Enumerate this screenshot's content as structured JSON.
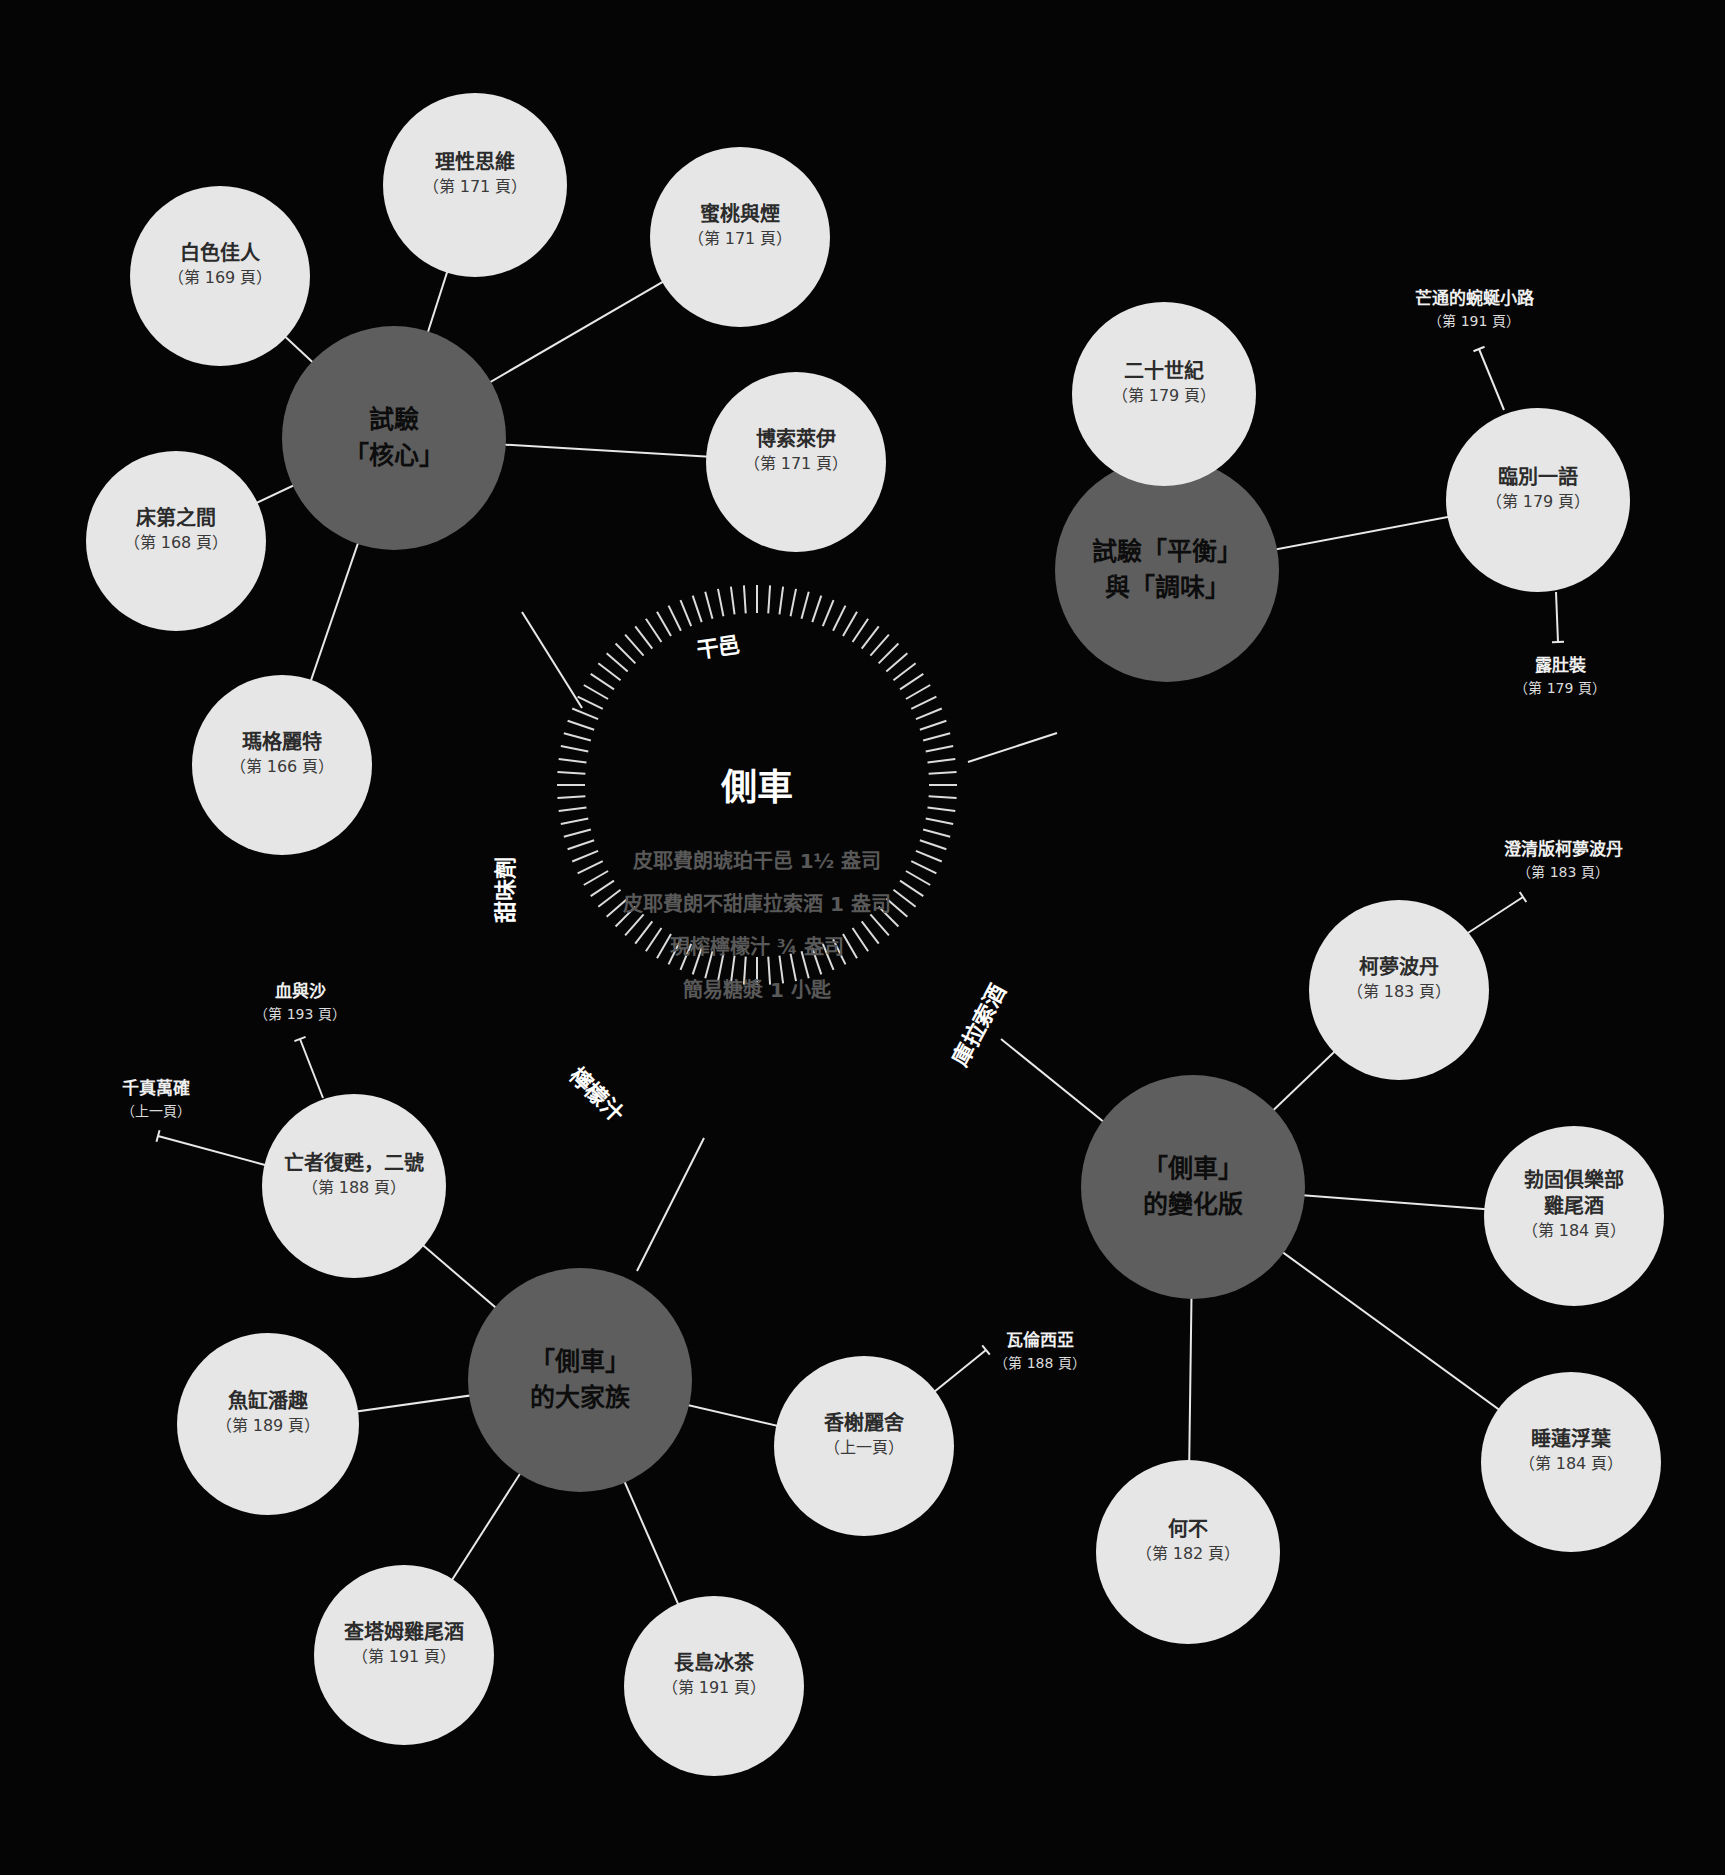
{
  "colors": {
    "background": "#050505",
    "leaf_fill": "#e6e6e6",
    "hub_fill": "#5e5e5e",
    "line": "#e8e8e8",
    "ingredient_text": "#595959"
  },
  "center": {
    "title": "側車",
    "ingredients": [
      "皮耶費朗琥珀干邑 1½ 盎司",
      "皮耶費朗不甜庫拉索酒 1 盎司",
      "現榨檸檬汁 ¾ 盎司",
      "簡易糖漿 1 小匙"
    ],
    "ring_labels": [
      {
        "id": "cognac",
        "text": "干邑",
        "x": 718,
        "y": 645,
        "rotate": -8
      },
      {
        "id": "sweetener",
        "text": "甜味劑",
        "x": 503,
        "y": 890,
        "rotate": -90
      },
      {
        "id": "lemon",
        "text": "檸檬汁",
        "x": 598,
        "y": 1093,
        "rotate": 45
      },
      {
        "id": "curacao",
        "text": "庫拉索酒",
        "x": 977,
        "y": 1024,
        "rotate": -62
      }
    ]
  },
  "hubs": [
    {
      "id": "core",
      "label": "試驗\n「核心」",
      "x": 394,
      "y": 438,
      "r": 112
    },
    {
      "id": "balance",
      "label": "試驗「平衡」\n與「調味」",
      "x": 1167,
      "y": 570,
      "r": 112
    },
    {
      "id": "variations",
      "label": "「側車」\n的變化版",
      "x": 1193,
      "y": 1187,
      "r": 112
    },
    {
      "id": "family",
      "label": "「側車」\n的大家族",
      "x": 580,
      "y": 1380,
      "r": 112
    }
  ],
  "leaves": [
    {
      "id": "white-lady",
      "hub": "core",
      "name": "白色佳人",
      "page": "（第 169 頁）",
      "x": 220,
      "y": 276,
      "r": 90
    },
    {
      "id": "rational",
      "hub": "core",
      "name": "理性思維",
      "page": "（第 171 頁）",
      "x": 475,
      "y": 185,
      "r": 92
    },
    {
      "id": "peach-smoke",
      "hub": "core",
      "name": "蜜桃與煙",
      "page": "（第 171 頁）",
      "x": 740,
      "y": 237,
      "r": 90
    },
    {
      "id": "beausoleil",
      "hub": "core",
      "name": "博索萊伊",
      "page": "（第 171 頁）",
      "x": 796,
      "y": 462,
      "r": 90
    },
    {
      "id": "between-sheets",
      "hub": "core",
      "name": "床第之間",
      "page": "（第 168 頁）",
      "x": 176,
      "y": 541,
      "r": 90
    },
    {
      "id": "margarita",
      "hub": "core",
      "name": "瑪格麗特",
      "page": "（第 166 頁）",
      "x": 282,
      "y": 765,
      "r": 90
    },
    {
      "id": "twentieth-century",
      "hub": "balance",
      "name": "二十世紀",
      "page": "（第 179 頁）",
      "x": 1164,
      "y": 394,
      "r": 92
    },
    {
      "id": "last-word",
      "hub": "balance",
      "name": "臨別一語",
      "page": "（第 179 頁）",
      "x": 1538,
      "y": 500,
      "r": 92
    },
    {
      "id": "cosmopolitan",
      "hub": "variations",
      "name": "柯夢波丹",
      "page": "（第 183 頁）",
      "x": 1399,
      "y": 990,
      "r": 90
    },
    {
      "id": "pegu-club",
      "hub": "variations",
      "name": "勃固俱樂部\n雞尾酒",
      "page": "（第 184 頁）",
      "x": 1574,
      "y": 1216,
      "r": 90
    },
    {
      "id": "water-lily",
      "hub": "variations",
      "name": "睡蓮浮葉",
      "page": "（第 184 頁）",
      "x": 1571,
      "y": 1462,
      "r": 90
    },
    {
      "id": "why-not",
      "hub": "variations",
      "name": "何不",
      "page": "（第 182 頁）",
      "x": 1188,
      "y": 1552,
      "r": 92
    },
    {
      "id": "corpse-reviver-2",
      "hub": "family",
      "name": "亡者復甦，二號",
      "page": "（第 188 頁）",
      "x": 354,
      "y": 1186,
      "r": 92
    },
    {
      "id": "fish-house-punch",
      "hub": "family",
      "name": "魚缸潘趣",
      "page": "（第 189 頁）",
      "x": 268,
      "y": 1424,
      "r": 91
    },
    {
      "id": "chatham",
      "hub": "family",
      "name": "查塔姆雞尾酒",
      "page": "（第 191 頁）",
      "x": 404,
      "y": 1655,
      "r": 90
    },
    {
      "id": "long-island",
      "hub": "family",
      "name": "長島冰茶",
      "page": "（第 191 頁）",
      "x": 714,
      "y": 1686,
      "r": 90
    },
    {
      "id": "champs-elysees",
      "hub": "family",
      "name": "香榭麗舍",
      "page": "（上一頁）",
      "x": 864,
      "y": 1446,
      "r": 90
    }
  ],
  "external_links": [
    {
      "id": "mango-mule",
      "from": "last-word",
      "name": "芒通的蜿蜒小路",
      "page": "（第 191 頁）",
      "label_x": 1474,
      "label_y": 287,
      "line_start": [
        1504,
        410
      ],
      "line_end": [
        1479,
        349
      ]
    },
    {
      "id": "bikini",
      "from": "last-word",
      "name": "露肚裝",
      "page": "（第 179 頁）",
      "label_x": 1560,
      "label_y": 654,
      "line_start": [
        1556,
        592
      ],
      "line_end": [
        1558,
        642
      ]
    },
    {
      "id": "clarified-cosmo",
      "from": "cosmopolitan",
      "name": "澄清版柯夢波丹",
      "page": "（第 183 頁）",
      "label_x": 1563,
      "label_y": 838,
      "line_start": [
        1451,
        944
      ],
      "line_end": [
        1523,
        897
      ]
    },
    {
      "id": "blood-and-sand",
      "from": "corpse-reviver-2",
      "name": "血與沙",
      "page": "（第 193 頁）",
      "label_x": 300,
      "label_y": 980,
      "line_start": [
        323,
        1098
      ],
      "line_end": [
        300,
        1039
      ]
    },
    {
      "id": "sure-thing",
      "from": "corpse-reviver-2",
      "name": "千真萬確",
      "page": "（上一頁）",
      "label_x": 156,
      "label_y": 1077,
      "line_start": [
        265,
        1165
      ],
      "line_end": [
        158,
        1136
      ]
    },
    {
      "id": "valencia",
      "from": "champs-elysees",
      "name": "瓦倫西亞",
      "page": "（第 188 頁）",
      "label_x": 1040,
      "label_y": 1329,
      "line_start": [
        934,
        1392
      ],
      "line_end": [
        986,
        1350
      ]
    }
  ],
  "center_connectors": [
    {
      "hub": "core",
      "from": [
        582,
        708
      ],
      "to": [
        522,
        612
      ]
    },
    {
      "hub": "balance",
      "from": [
        968,
        762
      ],
      "to": [
        1057,
        733
      ]
    },
    {
      "hub": "variations",
      "from": [
        1001,
        1039
      ],
      "to": [
        1110,
        1127
      ]
    },
    {
      "hub": "family",
      "from": [
        704,
        1138
      ],
      "to": [
        637,
        1271
      ]
    }
  ],
  "tick_ring": {
    "cx": 757,
    "cy": 785,
    "inner_r": 172,
    "outer_r": 200,
    "count": 96,
    "color": "#dcdcdc"
  }
}
